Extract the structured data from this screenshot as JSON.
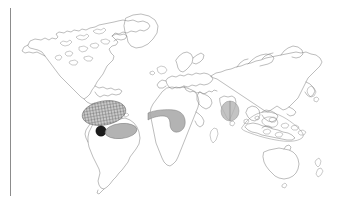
{
  "figure": {
    "background_color": "#ffffff",
    "margin_rule_color": "#8c8c8c",
    "coastline_color": "#7a7a7a"
  },
  "map": {
    "projection": "world-equirectangular",
    "landmasses": [
      {
        "name": "north-america",
        "label": "North America"
      },
      {
        "name": "greenland",
        "label": "Greenland"
      },
      {
        "name": "south-america",
        "label": "South America"
      },
      {
        "name": "europe",
        "label": "Europe"
      },
      {
        "name": "africa",
        "label": "Africa"
      },
      {
        "name": "asia",
        "label": "Asia"
      },
      {
        "name": "australia",
        "label": "Australia"
      },
      {
        "name": "new-zealand",
        "label": "New Zealand"
      },
      {
        "name": "japan",
        "label": "Japan"
      },
      {
        "name": "madagascar",
        "label": "Madagascar"
      },
      {
        "name": "southeast-asia-archipelago",
        "label": "Southeast Asian Archipelago"
      }
    ],
    "distribution_ranges": [
      {
        "id": "central-america-hatched",
        "region": "Central America / Caribbean",
        "style": "cross-hatched",
        "color": "#555555"
      },
      {
        "id": "northern-andes-point",
        "region": "Northern Andes locality",
        "style": "solid-black",
        "color": "#1c1c1c"
      },
      {
        "id": "northern-south-america-gray",
        "region": "Northern South America",
        "style": "solid-gray",
        "color": "#a8a8a8"
      },
      {
        "id": "west-central-africa-gray",
        "region": "West and Central Africa",
        "style": "solid-gray",
        "color": "#a8a8a8"
      },
      {
        "id": "india-sri-lanka-gray",
        "region": "India / Sri Lanka",
        "style": "solid-gray-soft",
        "color": "#b4b4b4"
      },
      {
        "id": "southeast-asia-outline",
        "region": "Southeast Asia / Indonesia",
        "style": "outline",
        "color": "#8a8a8a"
      }
    ]
  }
}
